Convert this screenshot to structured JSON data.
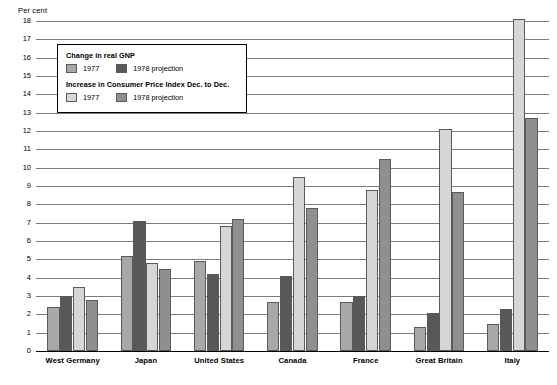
{
  "chart_data": {
    "type": "bar",
    "title": "",
    "subtitle": "",
    "xlabel": "",
    "ylabel": "Per cent",
    "ylim": [
      0,
      18
    ],
    "ytick_step": 1,
    "yticks": [
      "18",
      "17",
      "16",
      "15",
      "14",
      "13",
      "12",
      "11",
      "10",
      "9",
      "8",
      "7",
      "6",
      "5",
      "4",
      "3",
      "2",
      "1",
      "0"
    ],
    "grid": true,
    "grid_axis": "y",
    "legend_position": "inside-upper-left",
    "categories": [
      "West Germany",
      "Japan",
      "United States",
      "Canada",
      "France",
      "Great Britain",
      "Italy"
    ],
    "series": [
      {
        "name": "Change in real GNP 1977",
        "group": "Change in real GNP",
        "year": "1977",
        "color": "#a8a8a8",
        "values": [
          2.4,
          5.2,
          4.9,
          2.7,
          2.7,
          1.3,
          1.5
        ]
      },
      {
        "name": "Change in real GNP 1978 projection",
        "group": "Change in real GNP",
        "year": "1978 projection",
        "color": "#585858",
        "values": [
          3.0,
          7.1,
          4.2,
          4.1,
          3.0,
          2.1,
          2.3
        ]
      },
      {
        "name": "Increase in Consumer Price Index Dec. to Dec. 1977",
        "group": "Increase in Consumer Price Index Dec. to Dec.",
        "year": "1977",
        "color": "#d6d6d6",
        "values": [
          3.5,
          4.8,
          6.8,
          9.5,
          8.8,
          12.1,
          18.1
        ]
      },
      {
        "name": "Increase in Consumer Price Index Dec. to Dec. 1978 projection",
        "group": "Increase in Consumer Price Index Dec. to Dec.",
        "year": "1978 projection",
        "color": "#8f8f8f",
        "values": [
          2.8,
          4.5,
          7.2,
          7.8,
          10.5,
          8.7,
          12.7
        ]
      }
    ]
  },
  "axis": {
    "unit_label": "Per cent"
  },
  "legend": {
    "sections": [
      {
        "title": "Change in real GNP",
        "entries": [
          {
            "label": "1977",
            "color": "#a8a8a8"
          },
          {
            "label": "1978 projection",
            "color": "#585858"
          }
        ]
      },
      {
        "title": "Increase in Consumer Price Index Dec. to Dec.",
        "entries": [
          {
            "label": "1977",
            "color": "#d6d6d6"
          },
          {
            "label": "1978 projection",
            "color": "#8f8f8f"
          }
        ]
      }
    ]
  }
}
